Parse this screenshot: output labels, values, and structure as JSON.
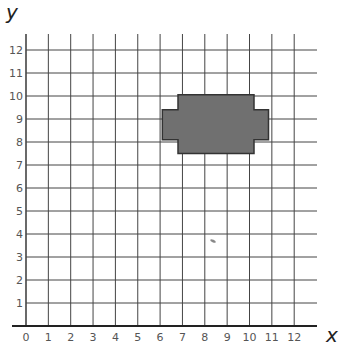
{
  "diagram": {
    "type": "coordinate_grid",
    "axes": {
      "x_label": "x",
      "y_label": "y",
      "x_ticks": [
        "0",
        "1",
        "2",
        "3",
        "4",
        "5",
        "6",
        "7",
        "8",
        "9",
        "10",
        "11",
        "12"
      ],
      "y_ticks": [
        "1",
        "2",
        "3",
        "4",
        "5",
        "6",
        "7",
        "8",
        "9",
        "10",
        "11",
        "12"
      ],
      "x_range": [
        0,
        13
      ],
      "y_range": [
        0,
        12.7
      ]
    },
    "shape": {
      "description": "Gray filled octagon-like stepped shape (cross/plus-like rectangle with notched side tabs)",
      "fill": "#707070",
      "stroke": "#333333",
      "vertices": [
        [
          6.8,
          10.05
        ],
        [
          10.2,
          10.05
        ],
        [
          10.2,
          9.4
        ],
        [
          10.85,
          9.4
        ],
        [
          10.85,
          8.1
        ],
        [
          10.2,
          8.1
        ],
        [
          10.2,
          7.5
        ],
        [
          6.8,
          7.5
        ],
        [
          6.8,
          8.1
        ],
        [
          6.1,
          8.1
        ],
        [
          6.1,
          9.4
        ],
        [
          6.8,
          9.4
        ]
      ]
    },
    "colors": {
      "grid": "#444444",
      "axis": "#222222",
      "background": "#ffffff"
    }
  },
  "chart_data": {
    "type": "scatter",
    "title": "",
    "xlabel": "x",
    "ylabel": "y",
    "xlim": [
      0,
      12
    ],
    "ylim": [
      0,
      12
    ],
    "grid": true,
    "x_ticks": [
      0,
      1,
      2,
      3,
      4,
      5,
      6,
      7,
      8,
      9,
      10,
      11,
      12
    ],
    "y_ticks": [
      1,
      2,
      3,
      4,
      5,
      6,
      7,
      8,
      9,
      10,
      11,
      12
    ],
    "series": [
      {
        "name": "shape-outline",
        "x": [
          6.8,
          10.2,
          10.2,
          10.85,
          10.85,
          10.2,
          10.2,
          6.8,
          6.8,
          6.1,
          6.1,
          6.8,
          6.8
        ],
        "y": [
          10.05,
          10.05,
          9.4,
          9.4,
          8.1,
          8.1,
          7.5,
          7.5,
          8.1,
          8.1,
          9.4,
          9.4,
          10.05
        ]
      }
    ]
  }
}
